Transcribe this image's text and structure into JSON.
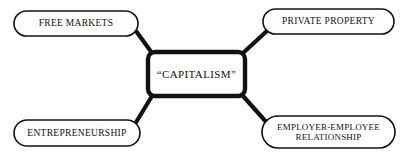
{
  "diagram": {
    "type": "mind-map",
    "title_node": {
      "id": "center",
      "label": "“CAPITALISM”",
      "shape": "rounded-rectangle",
      "border_width_px": 4,
      "x": 146,
      "y": 50,
      "w": 101,
      "h": 48
    },
    "branch_nodes": [
      {
        "id": "free-markets",
        "label": "FREE MARKETS",
        "shape": "stadium",
        "position": "top-left",
        "x": 14,
        "y": 11,
        "w": 124,
        "h": 25,
        "lines": 1
      },
      {
        "id": "private-property",
        "label": "PRIVATE  PROPERTY",
        "shape": "stadium",
        "position": "top-right",
        "x": 263,
        "y": 9,
        "w": 131,
        "h": 25,
        "lines": 1
      },
      {
        "id": "entrepreneurship",
        "label": "ENTREPRENEURSHIP",
        "shape": "stadium",
        "position": "bottom-left",
        "x": 14,
        "y": 120,
        "w": 126,
        "h": 26,
        "lines": 1
      },
      {
        "id": "employer-employee-relationship",
        "label": "EMPLOYER-EMPLOYEE\nRELATIONSHIP",
        "shape": "stadium",
        "position": "bottom-right",
        "x": 262,
        "y": 116,
        "w": 133,
        "h": 32,
        "lines": 2
      }
    ],
    "connectors": [
      {
        "id": "connector-free-markets",
        "from": "free-markets",
        "to": "center",
        "x1": 136,
        "y1": 31,
        "x2": 152,
        "y2": 53
      },
      {
        "id": "connector-private-property",
        "from": "private-property",
        "to": "center",
        "x1": 268,
        "y1": 30,
        "x2": 243,
        "y2": 53
      },
      {
        "id": "connector-entrepreneurship",
        "from": "entrepreneurship",
        "to": "center",
        "x1": 135,
        "y1": 124,
        "x2": 152,
        "y2": 96
      },
      {
        "id": "connector-employer-employee",
        "from": "employer-employee-relationship",
        "to": "center",
        "x1": 268,
        "y1": 124,
        "x2": 243,
        "y2": 96
      }
    ],
    "colors": {
      "background": "#ffffff",
      "stroke": "#121212",
      "text": "#111111",
      "fill": "#ffffff"
    },
    "stroke_widths": {
      "branch_node": 1.6,
      "center_node": 4,
      "connector": 4
    }
  }
}
